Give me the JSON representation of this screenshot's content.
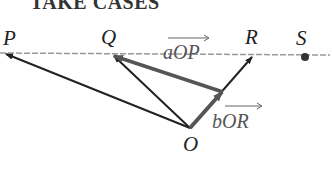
{
  "title": "TAKE CASES",
  "points": {
    "P": "P",
    "Q": "Q",
    "R": "R",
    "S": "S",
    "O": "O"
  },
  "vectors": {
    "aOP": "aOP",
    "bOR": "bOR"
  },
  "colors": {
    "line": "#222222",
    "vector": "#555555",
    "dashed": "#999999",
    "dot": "#333333"
  }
}
